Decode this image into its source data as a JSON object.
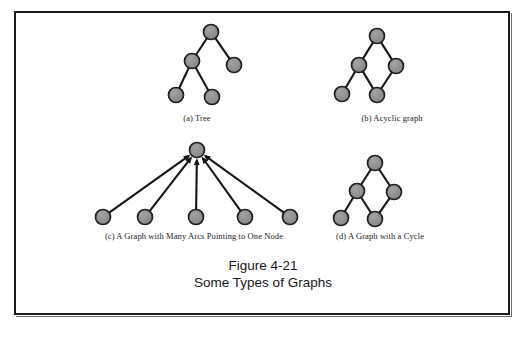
{
  "figure": {
    "number": "Figure 4-21",
    "subtitle": "Some Types of Graphs"
  },
  "panels": {
    "a": {
      "caption": "(a) Tree"
    },
    "b": {
      "caption": "(b) Acyclic graph"
    },
    "c": {
      "caption": "(c) A Graph with Many Arcs Pointing to One Node"
    },
    "d": {
      "caption": "(d) A Graph with a Cycle"
    }
  },
  "colors": {
    "node_fill": "#8c8c8c",
    "node_stroke": "#1f1f1f",
    "edge": "#161616",
    "frame": "#1b1b1b",
    "background": "#ffffff",
    "text": "#1a1a1a"
  },
  "chart_data": {
    "type": "diagram",
    "node_radius": 7.5,
    "graphs": [
      {
        "id": "a",
        "label": "(a) Tree",
        "directed": false,
        "nodes": [
          {
            "id": "a1",
            "x": 211,
            "y": 32
          },
          {
            "id": "a2",
            "x": 192,
            "y": 61
          },
          {
            "id": "a3",
            "x": 234,
            "y": 65
          },
          {
            "id": "a4",
            "x": 176,
            "y": 95
          },
          {
            "id": "a5",
            "x": 212,
            "y": 97
          }
        ],
        "edges": [
          {
            "from": "a1",
            "to": "a2"
          },
          {
            "from": "a1",
            "to": "a3"
          },
          {
            "from": "a2",
            "to": "a4"
          },
          {
            "from": "a2",
            "to": "a5"
          }
        ]
      },
      {
        "id": "b",
        "label": "(b) Acyclic graph",
        "directed": false,
        "nodes": [
          {
            "id": "b1",
            "x": 377,
            "y": 36
          },
          {
            "id": "b2",
            "x": 359,
            "y": 65
          },
          {
            "id": "b3",
            "x": 396,
            "y": 66
          },
          {
            "id": "b4",
            "x": 377,
            "y": 95
          },
          {
            "id": "b5",
            "x": 342,
            "y": 94
          }
        ],
        "edges": [
          {
            "from": "b1",
            "to": "b2"
          },
          {
            "from": "b1",
            "to": "b3"
          },
          {
            "from": "b2",
            "to": "b5"
          },
          {
            "from": "b2",
            "to": "b4"
          },
          {
            "from": "b3",
            "to": "b4"
          }
        ]
      },
      {
        "id": "c",
        "label": "(c) A Graph with Many Arcs Pointing to One Node",
        "directed": true,
        "nodes": [
          {
            "id": "hub",
            "x": 197,
            "y": 150
          },
          {
            "id": "c1",
            "x": 103,
            "y": 217
          },
          {
            "id": "c2",
            "x": 145,
            "y": 217
          },
          {
            "id": "c3",
            "x": 196,
            "y": 217
          },
          {
            "id": "c4",
            "x": 245,
            "y": 217
          },
          {
            "id": "c5",
            "x": 290,
            "y": 217
          }
        ],
        "edges": [
          {
            "from": "c1",
            "to": "hub"
          },
          {
            "from": "c2",
            "to": "hub"
          },
          {
            "from": "c3",
            "to": "hub"
          },
          {
            "from": "c4",
            "to": "hub"
          },
          {
            "from": "c5",
            "to": "hub"
          }
        ]
      },
      {
        "id": "d",
        "label": "(d) A Graph with a Cycle",
        "directed": false,
        "nodes": [
          {
            "id": "d1",
            "x": 375,
            "y": 163
          },
          {
            "id": "d2",
            "x": 357,
            "y": 191
          },
          {
            "id": "d3",
            "x": 394,
            "y": 192
          },
          {
            "id": "d4",
            "x": 375,
            "y": 219
          },
          {
            "id": "d5",
            "x": 341,
            "y": 218
          }
        ],
        "edges": [
          {
            "from": "d1",
            "to": "d2"
          },
          {
            "from": "d1",
            "to": "d3"
          },
          {
            "from": "d2",
            "to": "d5"
          },
          {
            "from": "d2",
            "to": "d4"
          },
          {
            "from": "d3",
            "to": "d4"
          }
        ]
      }
    ]
  }
}
